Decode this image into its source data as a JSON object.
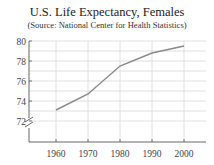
{
  "title": "U.S. Life Expectancy, Females",
  "subtitle": "(Source: National Center for Health Statistics)",
  "colors": {
    "line": "#8a8a8a",
    "grid": "#d8d8d8",
    "axis": "#555555"
  },
  "chart_data": {
    "type": "line",
    "title": "U.S. Life Expectancy, Females",
    "subtitle": "(Source: National Center for Health Statistics)",
    "xlabel": "",
    "ylabel": "",
    "x": [
      1960,
      1970,
      1980,
      1990,
      2000
    ],
    "series": [
      {
        "name": "Females",
        "values": [
          73.1,
          74.7,
          77.5,
          78.8,
          79.5
        ]
      }
    ],
    "x_ticks": [
      "1960",
      "1970",
      "1980",
      "1990",
      "2000"
    ],
    "y_ticks": [
      "72",
      "74",
      "76",
      "78",
      "80"
    ],
    "ylim": [
      71,
      80
    ],
    "axis_break": true,
    "grid": true
  }
}
